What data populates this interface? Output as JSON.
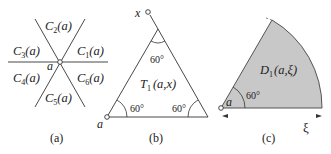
{
  "panels": {
    "a": {
      "caption": "(a)",
      "center_label": "a",
      "regions": [
        {
          "id": "C1",
          "base": "C",
          "sub": "1",
          "arg": "(a)"
        },
        {
          "id": "C2",
          "base": "C",
          "sub": "2",
          "arg": "(a)"
        },
        {
          "id": "C3",
          "base": "C",
          "sub": "3",
          "arg": "(a)"
        },
        {
          "id": "C4",
          "base": "C",
          "sub": "4",
          "arg": "(a)"
        },
        {
          "id": "C5",
          "base": "C",
          "sub": "5",
          "arg": "(a)"
        },
        {
          "id": "C6",
          "base": "C",
          "sub": "6",
          "arg": "(a)"
        }
      ]
    },
    "b": {
      "caption": "(b)",
      "vertex_top_label": "x",
      "vertex_left_label": "a",
      "triangle_label": {
        "base": "T",
        "sub": "1",
        "arg": "(a,x)"
      },
      "angles": [
        "60°",
        "60°",
        "60°"
      ]
    },
    "c": {
      "caption": "(c)",
      "vertex_label": "a",
      "sector_label": {
        "base": "D",
        "sub": "1",
        "arg": "(a,ξ)"
      },
      "angle": "60°",
      "radius_label": "ξ",
      "fill_color": "#c8c8c8"
    }
  }
}
